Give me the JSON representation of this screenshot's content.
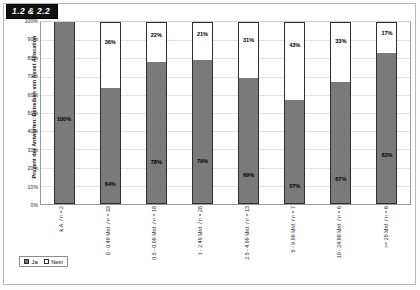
{
  "badge": {
    "label": "1.2 & 2.2"
  },
  "chart_data": {
    "type": "bar",
    "subtype": "100% stacked bar",
    "title": "1.2 & 2.2",
    "xlabel": "",
    "ylabel": "Prozent der Antworten: Betreiben von Asset Allocation",
    "ylim": [
      0,
      100
    ],
    "yticks": [
      "0%",
      "10%",
      "20%",
      "30%",
      "40%",
      "50%",
      "60%",
      "70%",
      "80%",
      "90%",
      "100%"
    ],
    "grid": true,
    "legend_position": "bottom-left",
    "categories": [
      "k.A. / n = 2",
      "0 - 0.49 Mrd. / n = 33",
      "0.5 - 0.99 Mrd. / n = 18",
      "1 - 2.49 Mrd. / n = 28",
      "2.5 - 4.99 Mrd. / n = 13",
      "5 - 9.99 Mrd. / n = 7",
      "10 - 24.99 Mrd. / n = 6",
      ">= 25 Mrd. / n = 6"
    ],
    "series": [
      {
        "name": "Ja",
        "color": "#7a7a7a",
        "values": [
          100,
          64,
          78,
          79,
          69,
          57,
          67,
          83
        ],
        "labels": [
          "100%",
          "64%",
          "78%",
          "79%",
          "69%",
          "57%",
          "67%",
          "83%"
        ]
      },
      {
        "name": "Nein",
        "color": "#ffffff",
        "values": [
          0,
          36,
          22,
          21,
          31,
          43,
          33,
          17
        ],
        "labels": [
          "",
          "36%",
          "22%",
          "21%",
          "31%",
          "43%",
          "33%",
          "17%"
        ]
      }
    ]
  },
  "legend": {
    "items": [
      {
        "label": "Ja",
        "swatch": "ja"
      },
      {
        "label": "Nein",
        "swatch": "nein"
      }
    ]
  }
}
